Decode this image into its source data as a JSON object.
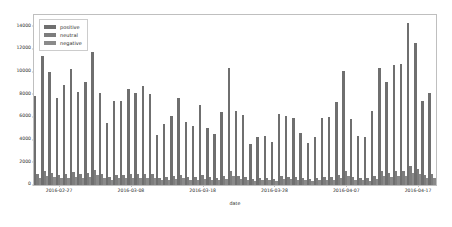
{
  "chart_data": {
    "type": "bar",
    "title": "",
    "xlabel": "date",
    "ylabel": "",
    "ylim": [
      0,
      15000
    ],
    "grid": false,
    "legend_position": "upper left",
    "ytick_labels": [
      "0",
      "2000",
      "4000",
      "6000",
      "8000",
      "10000",
      "12000",
      "14000"
    ],
    "ytick_values": [
      0,
      2000,
      4000,
      6000,
      8000,
      10000,
      12000,
      14000
    ],
    "xtick_labels": [
      "2016-02-27",
      "2016-03-08",
      "2016-03-18",
      "2016-03-28",
      "2016-04-07",
      "2016-04-17"
    ],
    "xtick_indices": [
      3,
      13,
      23,
      33,
      43,
      53
    ],
    "bar_color": "#6f6f6f",
    "neutral_color": "#7d7d7d",
    "negative_color": "#8a8a8a",
    "categories": [
      "2016-02-24",
      "2016-02-25",
      "2016-02-26",
      "2016-02-27",
      "2016-02-28",
      "2016-02-29",
      "2016-03-01",
      "2016-03-02",
      "2016-03-03",
      "2016-03-04",
      "2016-03-05",
      "2016-03-06",
      "2016-03-07",
      "2016-03-08",
      "2016-03-09",
      "2016-03-10",
      "2016-03-11",
      "2016-03-12",
      "2016-03-13",
      "2016-03-14",
      "2016-03-15",
      "2016-03-16",
      "2016-03-17",
      "2016-03-18",
      "2016-03-19",
      "2016-03-20",
      "2016-03-21",
      "2016-03-22",
      "2016-03-23",
      "2016-03-24",
      "2016-03-25",
      "2016-03-26",
      "2016-03-27",
      "2016-03-28",
      "2016-03-29",
      "2016-03-30",
      "2016-03-31",
      "2016-04-01",
      "2016-04-02",
      "2016-04-03",
      "2016-04-04",
      "2016-04-05",
      "2016-04-06",
      "2016-04-07",
      "2016-04-08",
      "2016-04-09",
      "2016-04-10",
      "2016-04-11",
      "2016-04-12",
      "2016-04-13",
      "2016-04-14",
      "2016-04-15",
      "2016-04-16",
      "2016-04-17",
      "2016-04-18",
      "2016-04-19"
    ],
    "series": [
      {
        "name": "positive",
        "color": "#6f6f6f",
        "values": [
          7850,
          11400,
          10000,
          7700,
          8800,
          10200,
          8250,
          9100,
          11750,
          8100,
          5450,
          7400,
          7450,
          8450,
          8150,
          8750,
          8050,
          4400,
          5350,
          6100,
          7700,
          5550,
          5200,
          7100,
          5050,
          4500,
          6450,
          10350,
          6550,
          6200,
          3650,
          4250,
          4300,
          3800,
          6300,
          6050,
          5950,
          4600,
          3700,
          4250,
          5900,
          6000,
          7300,
          10050,
          5800,
          4300,
          4200,
          6550,
          10300,
          9100,
          10600,
          10700,
          14300,
          12500,
          7450,
          8100
        ]
      },
      {
        "name": "neutral",
        "color": "#7d7d7d",
        "values": [
          950,
          1250,
          1050,
          900,
          1000,
          1150,
          950,
          1050,
          1300,
          950,
          700,
          900,
          900,
          1000,
          950,
          1000,
          950,
          600,
          700,
          800,
          900,
          700,
          700,
          850,
          700,
          600,
          800,
          1200,
          800,
          750,
          500,
          600,
          600,
          550,
          800,
          750,
          750,
          650,
          550,
          600,
          750,
          750,
          900,
          1200,
          750,
          600,
          600,
          800,
          1200,
          1100,
          1250,
          1250,
          1650,
          1450,
          900,
          1000
        ]
      },
      {
        "name": "negative",
        "color": "#8a8a8a",
        "values": [
          600,
          800,
          700,
          600,
          650,
          750,
          600,
          700,
          850,
          600,
          450,
          580,
          580,
          650,
          620,
          660,
          620,
          400,
          450,
          520,
          580,
          450,
          450,
          550,
          450,
          400,
          520,
          780,
          520,
          480,
          330,
          400,
          400,
          360,
          520,
          490,
          480,
          420,
          350,
          400,
          480,
          480,
          580,
          780,
          480,
          400,
          390,
          520,
          780,
          700,
          800,
          810,
          1080,
          950,
          580,
          640
        ]
      }
    ]
  },
  "legend": {
    "items": [
      {
        "label": "positive"
      },
      {
        "label": "neutral"
      },
      {
        "label": "negative"
      }
    ]
  }
}
